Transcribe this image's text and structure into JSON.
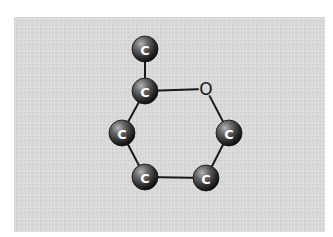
{
  "diagram": {
    "title": "",
    "background_color": "#ffffff",
    "panel_color": "#d9d9d9",
    "bond_color": "#1a1a1a",
    "atom_colors": {
      "C": "#3a3a3a",
      "C_highlight": "#9a9a9a",
      "O_text": "#1a1a1a"
    },
    "atoms": [
      {
        "id": "c_methyl",
        "element": "C",
        "label": "C",
        "x": 145,
        "y": 49
      },
      {
        "id": "c2",
        "element": "C",
        "label": "C",
        "x": 145,
        "y": 91
      },
      {
        "id": "o1",
        "element": "O",
        "label": "O",
        "x": 206,
        "y": 89
      },
      {
        "id": "c6",
        "element": "C",
        "label": "C",
        "x": 229,
        "y": 133
      },
      {
        "id": "c3",
        "element": "C",
        "label": "C",
        "x": 122,
        "y": 133
      },
      {
        "id": "c4",
        "element": "C",
        "label": "C",
        "x": 145,
        "y": 177
      },
      {
        "id": "c5",
        "element": "C",
        "label": "C",
        "x": 206,
        "y": 178
      }
    ],
    "bonds": [
      {
        "from": "c_methyl",
        "to": "c2"
      },
      {
        "from": "c2",
        "to": "o1"
      },
      {
        "from": "o1",
        "to": "c6"
      },
      {
        "from": "c6",
        "to": "c5"
      },
      {
        "from": "c5",
        "to": "c4"
      },
      {
        "from": "c4",
        "to": "c3"
      },
      {
        "from": "c3",
        "to": "c2"
      }
    ]
  }
}
